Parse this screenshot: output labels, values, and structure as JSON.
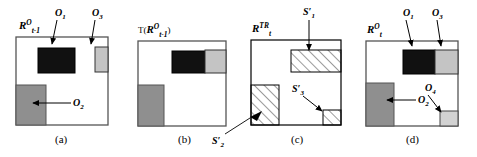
{
  "figure": {
    "panels": [
      {
        "id": "a",
        "caption": "(a)",
        "region_label": {
          "base": "R",
          "superscript": "O",
          "subscript": "t-1"
        },
        "objects": [
          {
            "name": "O",
            "subscript": "1",
            "fill": "#111111",
            "note": "black rectangle upper middle"
          },
          {
            "name": "O",
            "subscript": "2",
            "fill": "#8f8f8f",
            "note": "gray rectangle lower left"
          },
          {
            "name": "O",
            "subscript": "3",
            "fill": "#c4c4c4",
            "note": "light gray rectangle upper right"
          }
        ]
      },
      {
        "id": "b",
        "caption": "(b)",
        "operator": "T",
        "region_label": {
          "base": "R",
          "superscript": "O",
          "subscript": "t-1"
        },
        "objects": [
          {
            "name": "O",
            "subscript": "1",
            "fill": "#111111"
          },
          {
            "name": "O",
            "subscript": "2",
            "fill": "#8f8f8f"
          },
          {
            "name": "O",
            "subscript": "3",
            "fill": "#c4c4c4"
          }
        ],
        "outgoing_label": {
          "base": "S",
          "prime": "′",
          "subscript": "2"
        }
      },
      {
        "id": "c",
        "caption": "(c)",
        "region_label": {
          "base": "R",
          "superscript": "TR",
          "subscript": "t"
        },
        "regions": [
          {
            "name": "S",
            "prime": "′",
            "subscript": "1",
            "fill": "hatch",
            "note": "top band hatched"
          },
          {
            "name": "S",
            "prime": "′",
            "subscript": "2",
            "fill": "hatch",
            "note": "left block hatched"
          },
          {
            "name": "S",
            "prime": "′",
            "subscript": "3",
            "fill": "hatch",
            "note": "bottom right small hatched"
          }
        ]
      },
      {
        "id": "d",
        "caption": "(d)",
        "region_label": {
          "base": "R",
          "superscript": "O",
          "subscript": "t"
        },
        "objects": [
          {
            "name": "O",
            "subscript": "1",
            "fill": "#111111"
          },
          {
            "name": "O",
            "subscript": "2",
            "fill": "#8f8f8f"
          },
          {
            "name": "O",
            "subscript": "3",
            "fill": "#c4c4c4"
          },
          {
            "name": "O",
            "subscript": "4",
            "fill": "#d2d2d2"
          }
        ]
      }
    ],
    "colors": {
      "background": "#ffffff",
      "stroke": "#000000",
      "object_black": "#111111",
      "object_gray": "#8f8f8f",
      "object_light_gray": "#c4c4c4",
      "object_pale_gray": "#d2d2d2"
    }
  }
}
